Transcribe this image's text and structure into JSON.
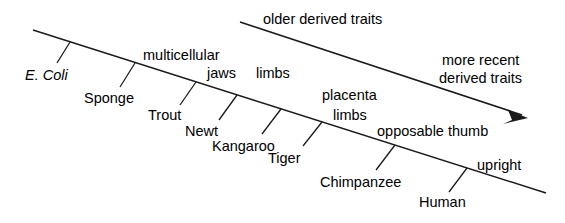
{
  "figure": {
    "type": "cladogram-timeline",
    "background_color": "#ffffff",
    "line_color": "#1a1a1a",
    "text_color": "#000000",
    "axis": {
      "name": "derived-traits-axis",
      "description": "long diagonal line descending left-to-right"
    }
  },
  "direction_arrow": {
    "name": "direction-arrow",
    "start_label": "older derived traits",
    "end_label_line1": "more recent",
    "end_label_line2": "derived traits",
    "end_label": "more recent derived traits"
  },
  "trait_labels": [
    {
      "id": "multicellular",
      "text": "multicellular"
    },
    {
      "id": "jaws",
      "text": "jaws"
    },
    {
      "id": "limbs-upper",
      "text": "limbs"
    },
    {
      "id": "placenta",
      "text": "placenta"
    },
    {
      "id": "limbs-lower",
      "text": "limbs"
    },
    {
      "id": "opposable-thumb",
      "text": "opposable thumb"
    },
    {
      "id": "upright",
      "text": "upright"
    }
  ],
  "organism_labels": [
    {
      "id": "e-coli",
      "text": "E. Coli",
      "italic": true
    },
    {
      "id": "sponge",
      "text": "Sponge",
      "italic": false
    },
    {
      "id": "trout",
      "text": "Trout",
      "italic": false
    },
    {
      "id": "newt",
      "text": "Newt",
      "italic": false
    },
    {
      "id": "kangaroo",
      "text": "Kangaroo",
      "italic": false
    },
    {
      "id": "tiger",
      "text": "Tiger",
      "italic": false
    },
    {
      "id": "chimpanzee",
      "text": "Chimpanzee",
      "italic": false
    },
    {
      "id": "human",
      "text": "Human",
      "italic": false
    }
  ]
}
